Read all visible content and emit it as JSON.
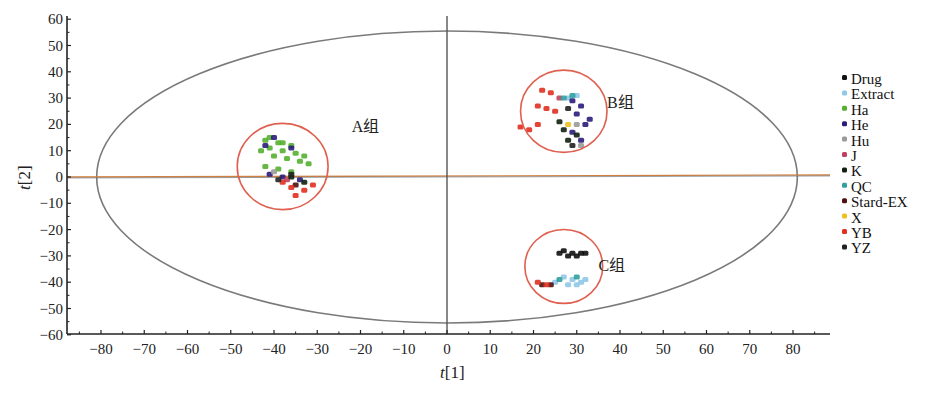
{
  "chart_data": {
    "type": "scatter",
    "title": "",
    "xlabel": "t[1]",
    "ylabel": "t[2]",
    "xlim": [
      -88,
      88
    ],
    "ylim": [
      -60,
      62
    ],
    "xticks": [
      -80,
      -70,
      -60,
      -50,
      -40,
      -30,
      -20,
      -10,
      0,
      10,
      20,
      30,
      40,
      50,
      60,
      70,
      80
    ],
    "yticks": [
      60,
      50,
      40,
      30,
      20,
      10,
      0,
      -10,
      -20,
      -30,
      -40,
      -50,
      -60
    ],
    "grid": false,
    "legend_position": "right",
    "hotelling_ellipse": {
      "center": [
        0,
        0
      ],
      "rx": 81,
      "ry": 55.5
    },
    "groups": [
      {
        "label": "A组",
        "center": [
          -38,
          4
        ],
        "radius_x": 10.5,
        "label_pos": [
          -22,
          19
        ]
      },
      {
        "label": "B组",
        "center": [
          27,
          25
        ],
        "radius_x": 10,
        "label_pos": [
          37,
          28
        ]
      },
      {
        "label": "C组",
        "center": [
          27,
          -34
        ],
        "radius_x": 9,
        "label_pos": [
          35,
          -34
        ]
      }
    ],
    "series": [
      {
        "name": "Drug",
        "color": "#111111",
        "points": [
          [
            27,
            -28
          ],
          [
            29,
            -29
          ],
          [
            31,
            -29
          ],
          [
            28,
            -30
          ],
          [
            30,
            -30
          ],
          [
            32,
            -29
          ],
          [
            26,
            -29
          ]
        ]
      },
      {
        "name": "Extract",
        "color": "#8fc8e8",
        "points": [
          [
            27,
            -38
          ],
          [
            29,
            -39
          ],
          [
            31,
            -40
          ],
          [
            25,
            -40
          ],
          [
            28,
            -41
          ],
          [
            30,
            -41
          ],
          [
            32,
            -39
          ],
          [
            28,
            30
          ],
          [
            30,
            31
          ]
        ]
      },
      {
        "name": "Ha",
        "color": "#55b030",
        "points": [
          [
            -42,
            14
          ],
          [
            -39,
            13
          ],
          [
            -36,
            12
          ],
          [
            -41,
            11
          ],
          [
            -38,
            10
          ],
          [
            -35,
            9
          ],
          [
            -40,
            8
          ],
          [
            -37,
            7
          ],
          [
            -34,
            6
          ],
          [
            -32,
            5
          ],
          [
            -42,
            4
          ],
          [
            -39,
            3
          ],
          [
            -36,
            2
          ],
          [
            -41,
            15
          ],
          [
            -33,
            8
          ],
          [
            -38,
            13
          ],
          [
            -43,
            10
          ]
        ]
      },
      {
        "name": "He",
        "color": "#2a1d7a",
        "points": [
          [
            -42,
            12
          ],
          [
            -40,
            15
          ],
          [
            -36,
            11
          ],
          [
            -41,
            1
          ],
          [
            -38,
            0
          ],
          [
            -34,
            -1
          ],
          [
            29,
            29
          ],
          [
            31,
            27
          ],
          [
            30,
            24
          ],
          [
            32,
            20
          ],
          [
            29,
            17
          ],
          [
            31,
            14
          ],
          [
            33,
            22
          ]
        ]
      },
      {
        "name": "Hu",
        "color": "#9a9a9a",
        "points": [
          [
            -40,
            2
          ],
          [
            30,
            20
          ],
          [
            31,
            12
          ]
        ]
      },
      {
        "name": "J",
        "color": "#c04060",
        "points": [
          [
            -37,
            -1
          ],
          [
            26,
            30
          ]
        ]
      },
      {
        "name": "K",
        "color": "#102010",
        "points": [
          [
            -36,
            0
          ],
          [
            -33,
            -2
          ],
          [
            27,
            18
          ],
          [
            28,
            14
          ],
          [
            30,
            16
          ],
          [
            26,
            21
          ]
        ]
      },
      {
        "name": "QC",
        "color": "#30a0a0",
        "points": [
          [
            27,
            30
          ],
          [
            29,
            31
          ],
          [
            30,
            -38
          ],
          [
            26,
            -39
          ]
        ]
      },
      {
        "name": "Stard-EX",
        "color": "#501010",
        "points": [
          [
            -35,
            -3
          ],
          [
            24,
            -41
          ],
          [
            22,
            -41
          ]
        ]
      },
      {
        "name": "X",
        "color": "#f0c020",
        "points": [
          [
            28,
            20
          ]
        ]
      },
      {
        "name": "YB",
        "color": "#e03020",
        "points": [
          [
            -36,
            -4
          ],
          [
            -33,
            -5
          ],
          [
            -35,
            -7
          ],
          [
            -38,
            -2
          ],
          [
            -31,
            -3
          ],
          [
            22,
            33
          ],
          [
            24,
            32
          ],
          [
            21,
            27
          ],
          [
            23,
            26
          ],
          [
            25,
            25
          ],
          [
            17,
            19
          ],
          [
            19,
            18
          ],
          [
            21,
            20
          ],
          [
            23,
            -41
          ],
          [
            21,
            -40
          ]
        ]
      },
      {
        "name": "YZ",
        "color": "#222222",
        "points": [
          [
            -39,
            -1
          ],
          [
            -36,
            1
          ],
          [
            28,
            26
          ],
          [
            29,
            12
          ]
        ]
      }
    ]
  },
  "legend": {
    "items": [
      {
        "label": "Drug",
        "color": "#111111"
      },
      {
        "label": "Extract",
        "color": "#8fc8e8"
      },
      {
        "label": "Ha",
        "color": "#55b030"
      },
      {
        "label": "He",
        "color": "#2a1d7a"
      },
      {
        "label": "Hu",
        "color": "#9a9a9a"
      },
      {
        "label": "J",
        "color": "#c04060"
      },
      {
        "label": "K",
        "color": "#102010"
      },
      {
        "label": "QC",
        "color": "#30a0a0"
      },
      {
        "label": "Stard-EX",
        "color": "#501010"
      },
      {
        "label": "X",
        "color": "#f0c020"
      },
      {
        "label": "YB",
        "color": "#e03020"
      },
      {
        "label": "YZ",
        "color": "#222222"
      }
    ]
  },
  "colors": {
    "axis": "#222222",
    "ellipse": "#7a7a7a",
    "group_circle": "#e06050",
    "zero_line_h": "#d08040",
    "zero_line_v": "#555555"
  }
}
